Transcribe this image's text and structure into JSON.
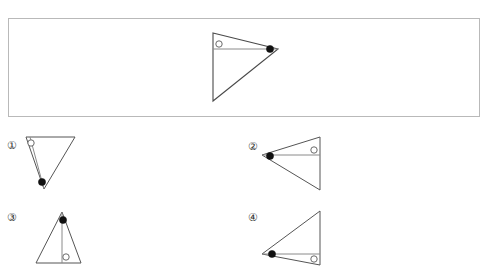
{
  "puzzle": {
    "type": "rotation-reflection-multiple-choice",
    "stimulus": {
      "name": "reference-figure",
      "description": "Right-pointing triangle with vertical left edge, internal horizontal segment, open circle near upper left, filled dot at right apex",
      "frame": {
        "x": 8,
        "y": 18,
        "width": 472,
        "height": 99
      },
      "triangle": {
        "vertices": [
          [
            212,
            32
          ],
          [
            277,
            48
          ],
          [
            212,
            100
          ]
        ],
        "inner_segment": [
          [
            212,
            48
          ],
          [
            277,
            48
          ]
        ],
        "open_circle": {
          "cx": 218,
          "cy": 43,
          "r": 3.2
        },
        "filled_dot": {
          "cx": 269,
          "cy": 48,
          "r": 3.6
        }
      }
    },
    "options": [
      {
        "id": "1",
        "label": "①",
        "label_pos": {
          "x": 4,
          "y": 138
        },
        "orientation": "down-pointing",
        "triangle": {
          "vertices": [
            [
              26,
              137
            ],
            [
              75,
              137
            ],
            [
              44,
              189
            ]
          ],
          "inner_segment": [
            [
              30,
              137
            ],
            [
              44,
              189
            ]
          ],
          "open_circle": {
            "cx": 31,
            "cy": 143,
            "r": 3.2
          },
          "filled_dot": {
            "cx": 42,
            "cy": 182,
            "r": 3.6
          }
        }
      },
      {
        "id": "2",
        "label": "②",
        "label_pos": {
          "x": 245,
          "y": 139
        },
        "orientation": "left-pointing",
        "triangle": {
          "vertices": [
            [
              262,
              155
            ],
            [
              320,
              137
            ],
            [
              320,
              190
            ]
          ],
          "inner_segment": [
            [
              262,
              155
            ],
            [
              320,
              155
            ]
          ],
          "open_circle": {
            "cx": 314,
            "cy": 150,
            "r": 3.2
          },
          "filled_dot": {
            "cx": 270,
            "cy": 156,
            "r": 3.6
          }
        }
      },
      {
        "id": "3",
        "label": "③",
        "label_pos": {
          "x": 4,
          "y": 210
        },
        "orientation": "up-pointing",
        "triangle": {
          "vertices": [
            [
              62,
              212
            ],
            [
              36,
              263
            ],
            [
              81,
              263
            ]
          ],
          "inner_segment": [
            [
              62,
              212
            ],
            [
              62,
              263
            ]
          ],
          "open_circle": {
            "cx": 66,
            "cy": 257,
            "r": 3.2
          },
          "filled_dot": {
            "cx": 63,
            "cy": 220,
            "r": 3.6
          }
        }
      },
      {
        "id": "4",
        "label": "④",
        "label_pos": {
          "x": 245,
          "y": 210
        },
        "orientation": "left-pointing-low",
        "triangle": {
          "vertices": [
            [
              262,
              254
            ],
            [
              320,
              211
            ],
            [
              320,
              265
            ]
          ],
          "inner_segment": [
            [
              262,
              254
            ],
            [
              320,
              254
            ]
          ],
          "open_circle": {
            "cx": 314,
            "cy": 259,
            "r": 3.2
          },
          "filled_dot": {
            "cx": 272,
            "cy": 254,
            "r": 3.6
          }
        }
      }
    ],
    "colors": {
      "frame_border": "#b9b9b9",
      "edge_stroke": "#555555",
      "inner_stroke": "#8a8a8a",
      "open_marker_fill": "#ffffff",
      "filled_marker_fill": "#111111",
      "background": "#ffffff",
      "label_text": "#303030"
    }
  }
}
